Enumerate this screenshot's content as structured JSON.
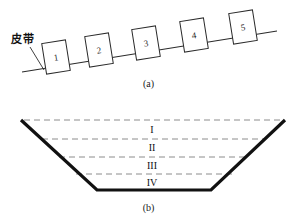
{
  "figure": {
    "background_color": "#ffffff",
    "line_color": "#2b2b2b",
    "dash_color": "#8c8c8c",
    "thick_color": "#111111",
    "panel_a": {
      "caption": "(a)",
      "belt_label": "皮带",
      "belt_label_icon": "leader-line",
      "boxes": [
        {
          "label": "1"
        },
        {
          "label": "2"
        },
        {
          "label": "3"
        },
        {
          "label": "4"
        },
        {
          "label": "5"
        }
      ]
    },
    "panel_b": {
      "caption": "(b)",
      "layers": [
        {
          "label": "I"
        },
        {
          "label": "II"
        },
        {
          "label": "III"
        },
        {
          "label": "IV"
        }
      ]
    }
  }
}
